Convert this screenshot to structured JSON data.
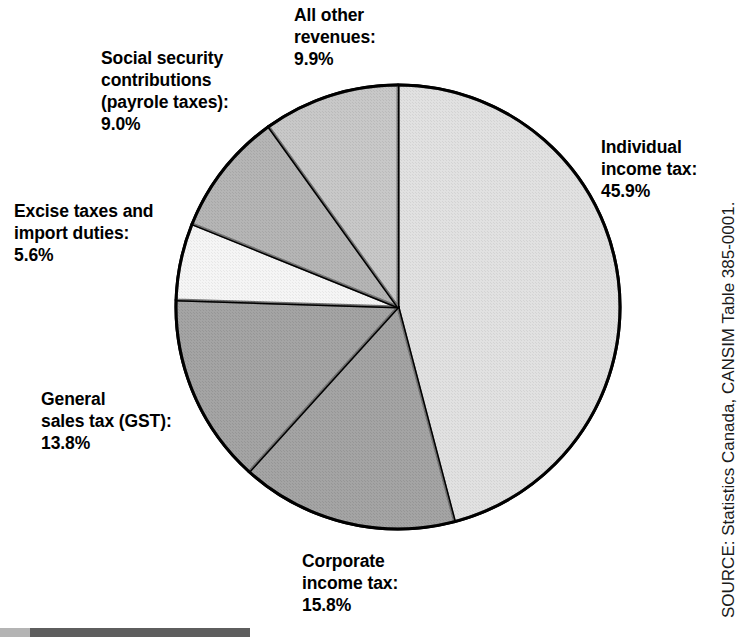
{
  "chart_data": {
    "type": "pie",
    "title": "",
    "subtitle": "",
    "xlabel": "",
    "ylabel": "",
    "legend_position": "none",
    "grid": false,
    "units": "percent",
    "start_angle_deg": 0,
    "direction": "clockwise",
    "categories": [
      "Individual income tax",
      "Corporate income tax",
      "General sales tax (GST)",
      "Excise taxes and import duties",
      "Social security contributions (payrole taxes)",
      "All other revenues"
    ],
    "values": [
      45.9,
      15.8,
      13.8,
      5.6,
      9.0,
      9.9
    ],
    "slices": [
      {
        "name": "Individual income tax",
        "label_line1": "Individual",
        "label_line2": "income tax:",
        "label_line3": "45.9%",
        "value": 45.9,
        "value_text": "45.9%",
        "color": "#c9c9c9"
      },
      {
        "name": "Corporate income tax",
        "label_line1": "Corporate",
        "label_line2": "income tax:",
        "label_line3": "15.8%",
        "value": 15.8,
        "value_text": "15.8%",
        "color": "#595959"
      },
      {
        "name": "General sales tax (GST)",
        "label_line1": "General",
        "label_line2": "sales tax (GST):",
        "label_line3": "13.8%",
        "value": 13.8,
        "value_text": "13.8%",
        "color": "#595959"
      },
      {
        "name": "Excise taxes and import duties",
        "label_line1": "Excise taxes and",
        "label_line2": "import duties:",
        "label_line3": "5.6%",
        "value": 5.6,
        "value_text": "5.6%",
        "color": "#ececec"
      },
      {
        "name": "Social security contributions (payrole taxes)",
        "label_line1": "Social security",
        "label_line2": "contributions",
        "label_line3": "(payrole taxes):",
        "label_line4": "9.0%",
        "value": 9.0,
        "value_text": "9.0%",
        "color": "#787878"
      },
      {
        "name": "All other revenues",
        "label_line1": "All other",
        "label_line2": "revenues:",
        "label_line3": "9.9%",
        "value": 9.9,
        "value_text": "9.9%",
        "color": "#9b9b9b"
      }
    ]
  },
  "labels": {
    "all_other_revenues": "All other\nrevenues:\n9.9%",
    "social_security": "Social security\ncontributions\n(payrole taxes):\n9.0%",
    "excise_taxes": "Excise taxes and\nimport duties:\n5.6%",
    "general_sales_tax": "General\nsales tax (GST):\n13.8%",
    "corporate_income_tax": "Corporate\nincome tax:\n15.8%",
    "individual_income_tax": "Individual\nincome tax:\n45.9%"
  },
  "source": {
    "text": "SOURCE: Statistics Canada, CANSIM Table 385-0001."
  },
  "colors": {
    "individual_income_tax": "#c9c9c9",
    "corporate_income_tax": "#595959",
    "general_sales_tax": "#595959",
    "excise_taxes": "#ececec",
    "social_security": "#787878",
    "all_other_revenues": "#9b9b9b",
    "outline": "#000000",
    "background": "#ffffff",
    "rule_light": "#b4b4b4",
    "rule_dark": "#5e5e5e"
  }
}
